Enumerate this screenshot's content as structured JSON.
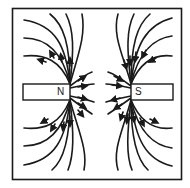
{
  "diagram": {
    "type": "magnetic-field-lines",
    "magnets": [
      {
        "label": "N",
        "side": "left"
      },
      {
        "label": "S",
        "side": "right"
      }
    ],
    "colors": {
      "stroke": "#1a1a1a",
      "background": "#ffffff"
    }
  }
}
